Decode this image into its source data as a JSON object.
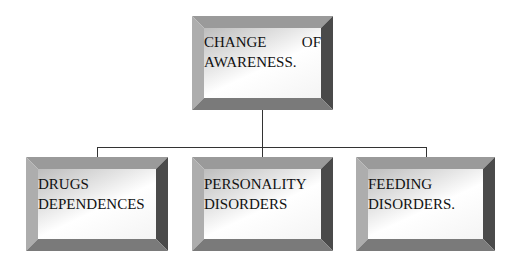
{
  "diagram": {
    "type": "hierarchy",
    "root": {
      "line1": "CHANGE",
      "line1b": "OF",
      "line2": "AWARENESS."
    },
    "children": [
      {
        "line1": "DRUGS",
        "line2": "DEPENDENCES"
      },
      {
        "line1": "PERSONALITY",
        "line2": "DISORDERS"
      },
      {
        "line1": "FEEDING",
        "line2": "DISORDERS."
      }
    ],
    "colors": {
      "bevel_top": "#9a9a9a",
      "bevel_left": "#adadad",
      "bevel_right": "#4a4a4a",
      "bevel_bottom": "#7a7a7a",
      "line": "#333333"
    }
  }
}
